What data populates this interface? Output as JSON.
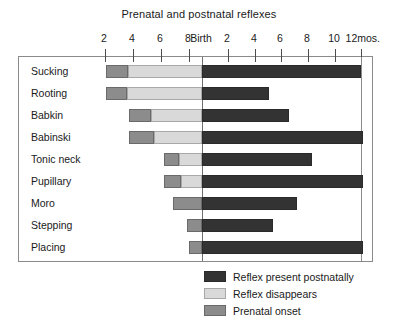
{
  "chart_data": {
    "type": "bar",
    "title": "Prenatal and postnatal reflexes",
    "subtitle": "",
    "xlabel": "",
    "ylabel": "",
    "orientation": "horizontal",
    "grid": false,
    "legend_position": "bottom-right",
    "x_unit": "months",
    "x_unit_suffix": "mos.",
    "xlim": [
      -9,
      12
    ],
    "x_origin_label": "Birth",
    "axis_ticks": [
      {
        "label": "2",
        "value": -2,
        "pixel_x": 104
      },
      {
        "label": "4",
        "value": -4,
        "pixel_x": 132
      },
      {
        "label": "6",
        "value": -6,
        "pixel_x": 160
      },
      {
        "label": "8",
        "value": -8,
        "pixel_x": 188
      },
      {
        "label": "Birth",
        "value": 0,
        "pixel_x": 201
      },
      {
        "label": "2",
        "value": 2,
        "pixel_x": 227
      },
      {
        "label": "4",
        "value": 4,
        "pixel_x": 254
      },
      {
        "label": "6",
        "value": 6,
        "pixel_x": 280
      },
      {
        "label": "8",
        "value": 8,
        "pixel_x": 307
      },
      {
        "label": "10",
        "value": 10,
        "pixel_x": 334
      },
      {
        "label": "12mos.",
        "value": 12,
        "pixel_x": 360
      }
    ],
    "categories": [
      "Sucking",
      "Rooting",
      "Babkin",
      "Babinski",
      "Tonic neck",
      "Pupillary",
      "Moro",
      "Stepping",
      "Placing"
    ],
    "series": [
      {
        "name": "Prenatal onset",
        "color": "#8c8c8c"
      },
      {
        "name": "Reflex disappears",
        "color": "#d9d9d9"
      },
      {
        "name": "Reflex present postnatally",
        "color": "#333333"
      }
    ],
    "rows": [
      {
        "label": "Sucking",
        "prenatal_onset_start": 105,
        "prenatal_onset_end": 127,
        "disappears_start": 127,
        "disappears_end": 201,
        "postnatal_start": 201,
        "postnatal_end": 360
      },
      {
        "label": "Rooting",
        "prenatal_onset_start": 105,
        "prenatal_onset_end": 126,
        "disappears_start": 126,
        "disappears_end": 201,
        "postnatal_start": 201,
        "postnatal_end": 268
      },
      {
        "label": "Babkin",
        "prenatal_onset_start": 128,
        "prenatal_onset_end": 150,
        "disappears_start": 150,
        "disappears_end": 201,
        "postnatal_start": 201,
        "postnatal_end": 288
      },
      {
        "label": "Babinski",
        "prenatal_onset_start": 128,
        "prenatal_onset_end": 153,
        "disappears_start": 153,
        "disappears_end": 201,
        "postnatal_start": 201,
        "postnatal_end": 362
      },
      {
        "label": "Tonic neck",
        "prenatal_onset_start": 163,
        "prenatal_onset_end": 178,
        "disappears_start": 178,
        "disappears_end": 201,
        "postnatal_start": 201,
        "postnatal_end": 311
      },
      {
        "label": "Pupillary",
        "prenatal_onset_start": 163,
        "prenatal_onset_end": 180,
        "disappears_start": 180,
        "disappears_end": 201,
        "postnatal_start": 201,
        "postnatal_end": 362
      },
      {
        "label": "Moro",
        "prenatal_onset_start": 172,
        "prenatal_onset_end": 201,
        "disappears_start": 0,
        "disappears_end": 0,
        "postnatal_start": 201,
        "postnatal_end": 296
      },
      {
        "label": "Stepping",
        "prenatal_onset_start": 186,
        "prenatal_onset_end": 201,
        "disappears_start": 0,
        "disappears_end": 0,
        "postnatal_start": 201,
        "postnatal_end": 272
      },
      {
        "label": "Placing",
        "prenatal_onset_start": 188,
        "prenatal_onset_end": 201,
        "disappears_start": 0,
        "disappears_end": 0,
        "postnatal_start": 201,
        "postnatal_end": 362
      }
    ],
    "legend": [
      {
        "label": "Reflex present postnatally",
        "color": "#333333",
        "border": "#2a2a2a"
      },
      {
        "label": "Reflex disappears",
        "color": "#d9d9d9",
        "border": "#a8a8a8"
      },
      {
        "label": "Prenatal onset",
        "color": "#8c8c8c",
        "border": "#6a6a6a"
      }
    ],
    "colors": {
      "postnatal": "#333333",
      "disappears": "#d9d9d9",
      "prenatal": "#8c8c8c",
      "frame": "#8a8a8a",
      "text": "#1a1a1a",
      "background": "#ffffff"
    }
  }
}
